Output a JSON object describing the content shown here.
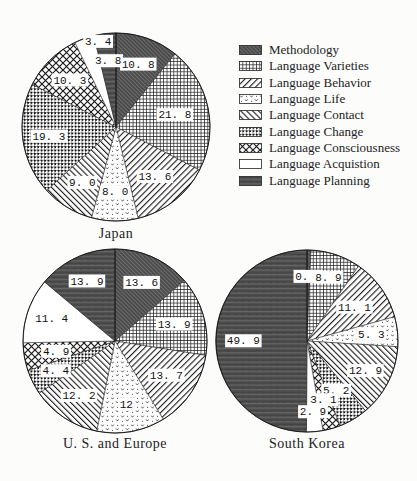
{
  "page": {
    "background": "#fcfcfb",
    "width": 417,
    "height": 481
  },
  "legend": {
    "position": "top-right",
    "items": [
      {
        "label": "Methodology",
        "pattern": "methodology"
      },
      {
        "label": "Language Varieties",
        "pattern": "varieties"
      },
      {
        "label": "Language Behavior",
        "pattern": "behavior"
      },
      {
        "label": "Language Life",
        "pattern": "life"
      },
      {
        "label": "Language Contact",
        "pattern": "contact"
      },
      {
        "label": "Language Change",
        "pattern": "change"
      },
      {
        "label": "Language Consciousness",
        "pattern": "consciousness"
      },
      {
        "label": "Language Acquistion",
        "pattern": "acquisition"
      },
      {
        "label": "Language Planning",
        "pattern": "planning"
      }
    ]
  },
  "chart_data": [
    {
      "type": "pie",
      "title": "Japan",
      "start_angle": "12-oclock",
      "direction": "clockwise",
      "categories": [
        "Methodology",
        "Language Varieties",
        "Language Behavior",
        "Language Life",
        "Language Contact",
        "Language Change",
        "Language Consciousness",
        "Language Acquistion",
        "Language Planning"
      ],
      "values": [
        10.8,
        21.8,
        13.6,
        8.0,
        9.0,
        19.3,
        10.3,
        3.4,
        3.8
      ],
      "display_labels": [
        "10. 8",
        "21. 8",
        "13. 6",
        "8. 0",
        "9. 0",
        "19. 3",
        "10. 3",
        "3. 4",
        "3. 8"
      ],
      "patterns": [
        "methodology",
        "varieties",
        "behavior",
        "life",
        "contact",
        "change",
        "consciousness",
        "acquisition",
        "planning"
      ],
      "layout": {
        "cx": 116,
        "cy": 127,
        "r": 94,
        "label_radius": [
          0.71,
          0.64,
          0.67,
          0.69,
          0.69,
          0.72,
          0.7,
          0.93,
          0.71
        ],
        "label_angle_offset_deg": [
          0,
          0,
          0,
          0,
          0,
          0,
          0,
          8,
          0
        ]
      }
    },
    {
      "type": "pie",
      "title": "U. S. and Europe",
      "start_angle": "12-oclock",
      "direction": "clockwise",
      "categories": [
        "Methodology",
        "Language Varieties",
        "Language Behavior",
        "Language Life",
        "Language Contact",
        "Language Change",
        "Language Consciousness",
        "Language Acquistion",
        "Language Planning"
      ],
      "values": [
        13.6,
        13.9,
        13.7,
        12.0,
        12.2,
        4.4,
        4.9,
        11.4,
        13.9
      ],
      "display_labels": [
        "13. 6",
        "13. 9",
        "13. 7",
        "12",
        "12. 2",
        "4. 4",
        "4. 9",
        "11. 4",
        "13. 9"
      ],
      "patterns": [
        "methodology",
        "varieties",
        "behavior",
        "life",
        "contact",
        "change",
        "consciousness",
        "acquisition",
        "planning"
      ],
      "layout": {
        "cx": 115,
        "cy": 341,
        "r": 92,
        "label_radius": [
          0.7,
          0.67,
          0.67,
          0.7,
          0.71,
          0.72,
          0.65,
          0.73,
          0.72
        ],
        "label_angle_offset_deg": [
          0,
          0,
          0,
          0,
          0,
          0,
          0,
          0,
          0
        ]
      }
    },
    {
      "type": "pie",
      "title": "South Korea",
      "start_angle": "12-oclock",
      "direction": "clockwise",
      "categories": [
        "Methodology",
        "Language Varieties",
        "Language Behavior",
        "Language Life",
        "Language Contact",
        "Language Change",
        "Language Consciousness",
        "Language Acquistion",
        "Language Planning"
      ],
      "values": [
        0.7,
        8.9,
        11.1,
        5.3,
        12.9,
        5.2,
        3.1,
        2.9,
        49.9
      ],
      "display_labels": [
        "0. 7",
        "8. 9",
        "11. 1",
        "5. 3",
        "12. 9",
        "5. 2",
        "3. 1",
        "2. 9",
        "49. 9"
      ],
      "patterns": [
        "methodology",
        "varieties",
        "behavior",
        "life",
        "contact",
        "change",
        "consciousness",
        "acquisition",
        "planning"
      ],
      "layout": {
        "cx": 307,
        "cy": 341,
        "r": 91,
        "label_radius": [
          0.71,
          0.74,
          0.64,
          0.71,
          0.72,
          0.63,
          0.67,
          0.78,
          0.7
        ],
        "label_angle_offset_deg": [
          0,
          0,
          0,
          0,
          0,
          0,
          0,
          0,
          0
        ]
      }
    }
  ]
}
